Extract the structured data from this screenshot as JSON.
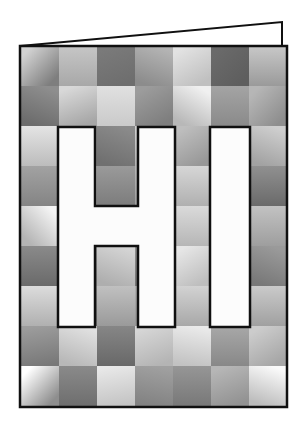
{
  "artwork": {
    "title": "HI",
    "subject": "greeting-card",
    "letters": [
      "H",
      "I"
    ],
    "letter_fill": "#fcfcfc",
    "letter_outline": "#101010",
    "card_outline": "#101010",
    "card_background": "#b0b0b0",
    "flap_fill": "#ffffff",
    "page_background": "#ffffff",
    "grid": {
      "columns": 7,
      "rows": 9,
      "cell_width": 38,
      "cell_height": 40,
      "origin_x": 21,
      "origin_y": 46
    },
    "card_frame": {
      "x": 20,
      "y": 46,
      "width": 267,
      "height": 361,
      "stroke_width": 2.5
    },
    "flap": {
      "apex_x": 282,
      "apex_y": 22,
      "hinge_x": 282,
      "hinge_y": 46,
      "left_x": 20,
      "left_y": 46,
      "stroke_width": 2
    },
    "letter_H": {
      "x": 58,
      "y": 127,
      "width": 117,
      "height": 200,
      "stem_width": 37,
      "crossbar_y": 206,
      "crossbar_height": 40
    },
    "letter_I": {
      "x": 210,
      "y": 127,
      "width": 40,
      "height": 200
    },
    "cells": [
      {
        "r": 0,
        "c": 0,
        "from": "#d2d2d2",
        "to": "#7e7e7e",
        "angle": 135
      },
      {
        "r": 0,
        "c": 1,
        "from": "#c6c6c6",
        "to": "#a8a8a8",
        "angle": 180
      },
      {
        "r": 0,
        "c": 2,
        "from": "#7a7a7a",
        "to": "#6e6e6e",
        "angle": 160
      },
      {
        "r": 0,
        "c": 3,
        "from": "#b4b4b4",
        "to": "#8c8c8c",
        "angle": 200
      },
      {
        "r": 0,
        "c": 4,
        "from": "#e2e2e2",
        "to": "#c0c0c0",
        "angle": 150
      },
      {
        "r": 0,
        "c": 5,
        "from": "#6a6a6a",
        "to": "#5e5e5e",
        "angle": 135
      },
      {
        "r": 0,
        "c": 6,
        "from": "#c8c8c8",
        "to": "#9a9a9a",
        "angle": 180
      },
      {
        "r": 1,
        "c": 0,
        "from": "#8e8e8e",
        "to": "#6c6c6c",
        "angle": 200
      },
      {
        "r": 1,
        "c": 1,
        "from": "#d8d8d8",
        "to": "#a6a6a6",
        "angle": 160
      },
      {
        "r": 1,
        "c": 2,
        "from": "#e0e0e0",
        "to": "#cacaca",
        "angle": 180
      },
      {
        "r": 1,
        "c": 3,
        "from": "#9c9c9c",
        "to": "#7e7e7e",
        "angle": 150
      },
      {
        "r": 1,
        "c": 4,
        "from": "#f0f0f0",
        "to": "#b8b8b8",
        "angle": 210
      },
      {
        "r": 1,
        "c": 5,
        "from": "#a4a4a4",
        "to": "#8a8a8a",
        "angle": 180
      },
      {
        "r": 1,
        "c": 6,
        "from": "#b6b6b6",
        "to": "#8e8e8e",
        "angle": 135
      },
      {
        "r": 2,
        "c": 0,
        "from": "#e4e4e4",
        "to": "#bcbcbc",
        "angle": 180
      },
      {
        "r": 2,
        "c": 1,
        "from": "#9e9e9e",
        "to": "#868686",
        "angle": 160
      },
      {
        "r": 2,
        "c": 2,
        "from": "#8a8a8a",
        "to": "#707070",
        "angle": 200
      },
      {
        "r": 2,
        "c": 3,
        "from": "#d0d0d0",
        "to": "#b2b2b2",
        "angle": 180
      },
      {
        "r": 2,
        "c": 4,
        "from": "#bebebe",
        "to": "#989898",
        "angle": 150
      },
      {
        "r": 2,
        "c": 5,
        "from": "#ededed",
        "to": "#c6c6c6",
        "angle": 180
      },
      {
        "r": 2,
        "c": 6,
        "from": "#cecece",
        "to": "#a2a2a2",
        "angle": 200
      },
      {
        "r": 3,
        "c": 0,
        "from": "#a2a2a2",
        "to": "#848484",
        "angle": 180
      },
      {
        "r": 3,
        "c": 1,
        "from": "#c4c4c4",
        "to": "#9c9c9c",
        "angle": 160
      },
      {
        "r": 3,
        "c": 2,
        "from": "#9a9a9a",
        "to": "#7c7c7c",
        "angle": 180
      },
      {
        "r": 3,
        "c": 3,
        "from": "#bcbcbc",
        "to": "#a0a0a0",
        "angle": 200
      },
      {
        "r": 3,
        "c": 4,
        "from": "#d6d6d6",
        "to": "#b0b0b0",
        "angle": 180
      },
      {
        "r": 3,
        "c": 5,
        "from": "#8c8c8c",
        "to": "#6e6e6e",
        "angle": 150
      },
      {
        "r": 3,
        "c": 6,
        "from": "#909090",
        "to": "#6a6a6a",
        "angle": 180
      },
      {
        "r": 4,
        "c": 0,
        "from": "#f4f4f4",
        "to": "#b4b4b4",
        "angle": 225
      },
      {
        "r": 4,
        "c": 1,
        "from": "#b0b0b0",
        "to": "#8e8e8e",
        "angle": 180
      },
      {
        "r": 4,
        "c": 2,
        "from": "#c8c8c8",
        "to": "#a6a6a6",
        "angle": 160
      },
      {
        "r": 4,
        "c": 3,
        "from": "#a6a6a6",
        "to": "#888888",
        "angle": 200
      },
      {
        "r": 4,
        "c": 4,
        "from": "#dadada",
        "to": "#b6b6b6",
        "angle": 180
      },
      {
        "r": 4,
        "c": 5,
        "from": "#aeaeae",
        "to": "#8c8c8c",
        "angle": 150
      },
      {
        "r": 4,
        "c": 6,
        "from": "#c2c2c2",
        "to": "#9e9e9e",
        "angle": 180
      },
      {
        "r": 5,
        "c": 0,
        "from": "#8a8a8a",
        "to": "#6a6a6a",
        "angle": 180
      },
      {
        "r": 5,
        "c": 1,
        "from": "#a0a0a0",
        "to": "#7e7e7e",
        "angle": 160
      },
      {
        "r": 5,
        "c": 2,
        "from": "#d4d4d4",
        "to": "#aeaeae",
        "angle": 200
      },
      {
        "r": 5,
        "c": 3,
        "from": "#909090",
        "to": "#747474",
        "angle": 180
      },
      {
        "r": 5,
        "c": 4,
        "from": "#e6e6e6",
        "to": "#bebebe",
        "angle": 150
      },
      {
        "r": 5,
        "c": 5,
        "from": "#b8b8b8",
        "to": "#949494",
        "angle": 180
      },
      {
        "r": 5,
        "c": 6,
        "from": "#9a9a9a",
        "to": "#787878",
        "angle": 200
      },
      {
        "r": 6,
        "c": 0,
        "from": "#dcdcdc",
        "to": "#b0b0b0",
        "angle": 180
      },
      {
        "r": 6,
        "c": 1,
        "from": "#8e8e8e",
        "to": "#707070",
        "angle": 160
      },
      {
        "r": 6,
        "c": 2,
        "from": "#c0c0c0",
        "to": "#9a9a9a",
        "angle": 180
      },
      {
        "r": 6,
        "c": 3,
        "from": "#b4b4b4",
        "to": "#969696",
        "angle": 200
      },
      {
        "r": 6,
        "c": 4,
        "from": "#d2d2d2",
        "to": "#a8a8a8",
        "angle": 180
      },
      {
        "r": 6,
        "c": 5,
        "from": "#a6a6a6",
        "to": "#868686",
        "angle": 150
      },
      {
        "r": 6,
        "c": 6,
        "from": "#cacaca",
        "to": "#a0a0a0",
        "angle": 180
      },
      {
        "r": 7,
        "c": 0,
        "from": "#9c9c9c",
        "to": "#787878",
        "angle": 170
      },
      {
        "r": 7,
        "c": 1,
        "from": "#e0e0e0",
        "to": "#b8b8b8",
        "angle": 200
      },
      {
        "r": 7,
        "c": 2,
        "from": "#868686",
        "to": "#686868",
        "angle": 180
      },
      {
        "r": 7,
        "c": 3,
        "from": "#d6d6d6",
        "to": "#b4b4b4",
        "angle": 160
      },
      {
        "r": 7,
        "c": 4,
        "from": "#eaeaea",
        "to": "#c2c2c2",
        "angle": 190
      },
      {
        "r": 7,
        "c": 5,
        "from": "#a8a8a8",
        "to": "#888888",
        "angle": 180
      },
      {
        "r": 7,
        "c": 6,
        "from": "#cccccc",
        "to": "#a6a6a6",
        "angle": 150
      },
      {
        "r": 8,
        "c": 0,
        "from": "#ffffff",
        "to": "#8e8e8e",
        "angle": 135
      },
      {
        "r": 8,
        "c": 1,
        "from": "#8a8a8a",
        "to": "#6e6e6e",
        "angle": 180
      },
      {
        "r": 8,
        "c": 2,
        "from": "#e8e8e8",
        "to": "#c4c4c4",
        "angle": 170
      },
      {
        "r": 8,
        "c": 3,
        "from": "#a0a0a0",
        "to": "#828282",
        "angle": 190
      },
      {
        "r": 8,
        "c": 4,
        "from": "#969696",
        "to": "#787878",
        "angle": 180
      },
      {
        "r": 8,
        "c": 5,
        "from": "#b6b6b6",
        "to": "#929292",
        "angle": 160
      },
      {
        "r": 8,
        "c": 6,
        "from": "#fafafa",
        "to": "#bcbcbc",
        "angle": 200
      }
    ]
  }
}
